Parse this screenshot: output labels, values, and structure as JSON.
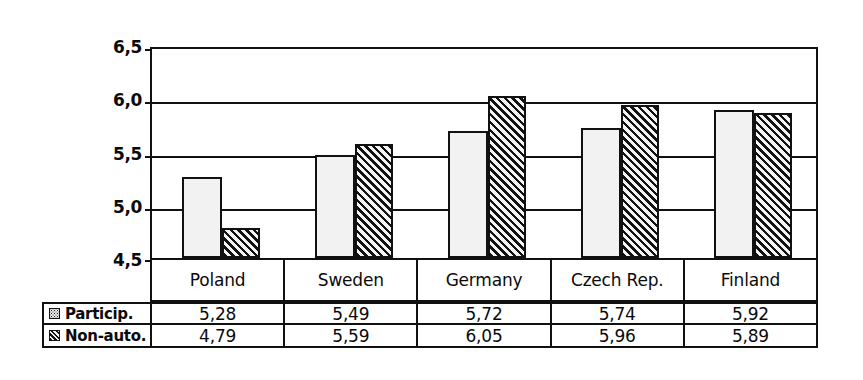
{
  "chart_data": {
    "type": "bar",
    "title": "",
    "subtitle": "",
    "xlabel": "",
    "ylabel": "",
    "categories": [
      "Poland",
      "Sweden",
      "Germany",
      "Czech Rep.",
      "Finland"
    ],
    "series": [
      {
        "name": "Particip.",
        "pattern": "dotted-light",
        "values": [
          5.28,
          5.49,
          5.72,
          5.74,
          5.92
        ],
        "labels": [
          "5,28",
          "5,49",
          "5,72",
          "5,74",
          "5,92"
        ]
      },
      {
        "name": "Non-auto.",
        "pattern": "diagonal-hatch-dark",
        "values": [
          4.79,
          5.59,
          6.05,
          5.96,
          5.89
        ],
        "labels": [
          "4,79",
          "5,59",
          "6,05",
          "5,96",
          "5,89"
        ]
      }
    ],
    "ylim": [
      4.5,
      6.5
    ],
    "yticks": [
      4.5,
      5.0,
      5.5,
      6.0,
      6.5
    ],
    "ytick_labels": [
      "4,5",
      "5,0",
      "5,5",
      "6,0",
      "6,5"
    ],
    "grid": true,
    "grid_axis": "y",
    "legend_position": "data-table-left",
    "decimal_separator": ",",
    "colors": {
      "axis": "#111111",
      "grid": "#111111",
      "series_participation_fill": "#f2f2f2",
      "series_nonauto_fill": "#333333",
      "background": "#ffffff",
      "text": "#0a0a0a"
    }
  },
  "axis": {
    "ytick_labels": [
      "6,5",
      "6,0",
      "5,5",
      "5,0",
      "4,5"
    ]
  },
  "category_row": {
    "cells": [
      "Poland",
      "Sweden",
      "Germany",
      "Czech Rep.",
      "Finland"
    ]
  },
  "table": {
    "rows": [
      {
        "legend": "Particip.",
        "swatch": "dotted-square-icon",
        "values": [
          "5,28",
          "5,49",
          "5,72",
          "5,74",
          "5,92"
        ]
      },
      {
        "legend": "Non-auto.",
        "swatch": "hatched-square-icon",
        "values": [
          "4,79",
          "5,59",
          "6,05",
          "5,96",
          "5,89"
        ]
      }
    ]
  }
}
